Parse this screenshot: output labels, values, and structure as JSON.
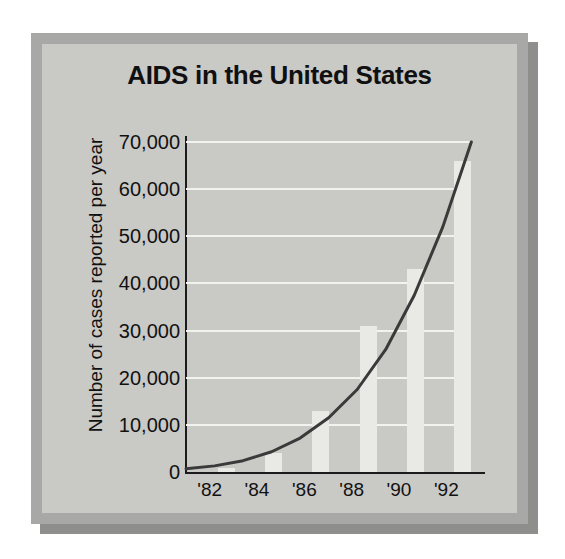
{
  "figure": {
    "title": "AIDS in the United States",
    "frame_color": "#a8a8a6",
    "panel_color": "#c9c9c6",
    "shadow_color": "#8e8e8c",
    "bar_color": "#e9e9e6",
    "curve_color": "#3a3a3a",
    "gridline_color": "#f2f2ef",
    "axis_color": "#1b1b1b",
    "text_color": "#111111"
  },
  "chart_data": {
    "type": "bar",
    "title": "AIDS in the United States",
    "xlabel": "",
    "ylabel": "Number of cases reported per year",
    "categories": [
      "'82",
      "'84",
      "'86",
      "'88",
      "'90",
      "'92"
    ],
    "values": [
      800,
      4000,
      13000,
      31000,
      43000,
      66000
    ],
    "ylim": [
      0,
      70000
    ],
    "ytick_labels": [
      "0",
      "10,000",
      "20,000",
      "30,000",
      "40,000",
      "50,000",
      "60,000",
      "70,000"
    ],
    "ytick_values": [
      0,
      10000,
      20000,
      30000,
      40000,
      50000,
      60000,
      70000
    ],
    "grid": "horizontal",
    "legend": "none",
    "series": [
      {
        "name": "Cases reported per year",
        "type": "bar",
        "values": [
          800,
          4000,
          13000,
          31000,
          43000,
          66000
        ]
      },
      {
        "name": "Exponential trend curve",
        "type": "line",
        "x": [
          "'82",
          "'83",
          "'84",
          "'85",
          "'86",
          "'87",
          "'88",
          "'89",
          "'90",
          "'91",
          "'92"
        ],
        "values": [
          700,
          1300,
          2400,
          4300,
          7200,
          11500,
          17500,
          26000,
          37500,
          52000,
          70000
        ]
      }
    ]
  }
}
